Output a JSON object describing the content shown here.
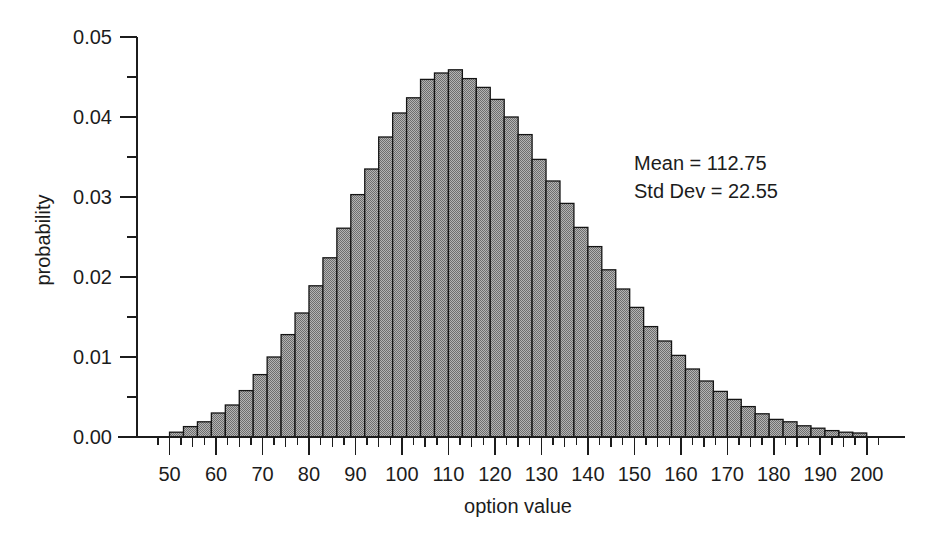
{
  "figure": {
    "background_color": "#ffffff",
    "ink_color": "#1c1c1c"
  },
  "annotations": {
    "mean_line": "Mean = 112.75",
    "stddev_line": "Std Dev = 22.55"
  },
  "chart_data": {
    "type": "bar",
    "title": "",
    "subtitle": "",
    "xlabel": "option value",
    "ylabel": "probability",
    "xlim": [
      43,
      205
    ],
    "ylim": [
      0.0,
      0.05
    ],
    "grid": false,
    "legend": null,
    "bar_fill_color": "#9c9c9c",
    "bar_edge_color": "#141414",
    "bin_width": 3,
    "x_tick_labels": [
      "50",
      "60",
      "70",
      "80",
      "90",
      "100",
      "110",
      "120",
      "130",
      "140",
      "150",
      "160",
      "170",
      "180",
      "190",
      "200"
    ],
    "x_ticks": [
      50,
      60,
      70,
      80,
      90,
      100,
      110,
      120,
      130,
      140,
      150,
      160,
      170,
      180,
      190,
      200
    ],
    "x_minor_ticks": [
      55,
      65,
      75,
      85,
      95,
      105,
      115,
      125,
      135,
      145,
      155,
      165,
      175,
      185,
      195
    ],
    "y_tick_labels": [
      "0.00",
      "0.01",
      "0.02",
      "0.03",
      "0.04",
      "0.05"
    ],
    "y_ticks": [
      0.0,
      0.01,
      0.02,
      0.03,
      0.04,
      0.05
    ],
    "y_minor_ticks": [
      0.005,
      0.015,
      0.025,
      0.035,
      0.045
    ],
    "categories": [
      51.5,
      54.5,
      57.5,
      60.5,
      63.5,
      66.5,
      69.5,
      72.5,
      75.5,
      78.5,
      81.5,
      84.5,
      87.5,
      90.5,
      93.5,
      96.5,
      99.5,
      102.5,
      105.5,
      108.5,
      111.5,
      114.5,
      117.5,
      120.5,
      123.5,
      126.5,
      129.5,
      132.5,
      135.5,
      138.5,
      141.5,
      144.5,
      147.5,
      150.5,
      153.5,
      156.5,
      159.5,
      162.5,
      165.5,
      168.5,
      171.5,
      174.5,
      177.5,
      180.5,
      183.5,
      186.5,
      189.5,
      192.5,
      195.5,
      198.5
    ],
    "values": [
      0.0006,
      0.0013,
      0.0019,
      0.003,
      0.004,
      0.0058,
      0.0078,
      0.01,
      0.0128,
      0.0155,
      0.0189,
      0.0224,
      0.0261,
      0.0303,
      0.0335,
      0.0375,
      0.0405,
      0.0424,
      0.0447,
      0.0455,
      0.0459,
      0.0448,
      0.0437,
      0.0422,
      0.04,
      0.0378,
      0.0347,
      0.032,
      0.0292,
      0.0262,
      0.0238,
      0.0209,
      0.0185,
      0.0162,
      0.0138,
      0.012,
      0.0102,
      0.0085,
      0.007,
      0.0057,
      0.0047,
      0.0038,
      0.0029,
      0.0022,
      0.0019,
      0.0014,
      0.0011,
      0.0008,
      0.0006,
      0.0005
    ],
    "distribution": {
      "mean": 112.75,
      "std_dev": 22.55,
      "shape": "right-skewed lognormal",
      "peak_value": 0.0459,
      "peak_x": 111.5
    }
  }
}
